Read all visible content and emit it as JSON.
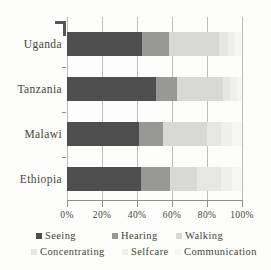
{
  "figure": {
    "background": "#fdfdfb",
    "grid_color": "#bdbdbb",
    "axis_color": "#8f8f8d",
    "text_color": "#454440"
  },
  "chart_data": {
    "type": "bar",
    "variant": "horizontal-stacked",
    "title": "",
    "xlabel": "",
    "ylabel": "",
    "categories": [
      "Uganda",
      "Tanzania",
      "Malawi",
      "Ethiopia"
    ],
    "series": [
      {
        "name": "Seeing",
        "color": "#4e4e4e",
        "values": [
          43,
          51,
          41,
          42
        ]
      },
      {
        "name": "Hearing",
        "color": "#989896",
        "values": [
          15,
          12,
          14,
          17
        ]
      },
      {
        "name": "Walking",
        "color": "#d8d8d5",
        "values": [
          29,
          26,
          25,
          15
        ]
      },
      {
        "name": "Concentrating",
        "color": "#e6e6e3",
        "values": [
          5,
          4,
          8,
          14
        ]
      },
      {
        "name": "Selfcare",
        "color": "#efefec",
        "values": [
          4,
          4,
          6,
          6
        ]
      },
      {
        "name": "Communication",
        "color": "#f6f6f3",
        "values": [
          4,
          3,
          6,
          6
        ]
      }
    ],
    "x_axis": {
      "range": [
        0,
        100
      ],
      "tick_values": [
        0,
        20,
        40,
        60,
        80,
        100
      ],
      "tick_labels": [
        "0%",
        "20%",
        "40%",
        "60%",
        "80%",
        "100%"
      ],
      "grid": true
    },
    "legend": {
      "position": "bottom",
      "rows": [
        [
          "Seeing",
          "Hearing",
          "Walking"
        ],
        [
          "Concentrating",
          "Selfcare",
          "Communication"
        ]
      ]
    }
  }
}
